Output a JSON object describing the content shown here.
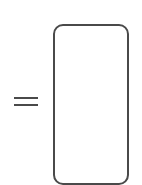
{
  "diagram": {
    "symbols": [
      {
        "type": "equals-sign",
        "color": "#4a4a4a"
      },
      {
        "type": "rounded-rectangle",
        "shape": "phone-outline",
        "stroke_color": "#4a4a4a",
        "fill_color": "#ffffff"
      }
    ]
  }
}
